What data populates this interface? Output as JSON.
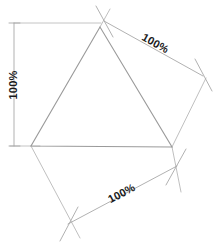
{
  "figure": {
    "background_color": "#ffffff",
    "shape_line_color": "#9a9a9a",
    "dimension_line_color": "#b4b4b4",
    "text_color": "#1a1a1a"
  },
  "shape": {
    "name": "triangle",
    "vertices": [
      {
        "label": "apex",
        "x": 100,
        "y": 27
      },
      {
        "label": "bottom-left",
        "x": 31,
        "y": 146
      },
      {
        "label": "bottom-right",
        "x": 172,
        "y": 147
      }
    ]
  },
  "dimensions": [
    {
      "id": "left",
      "label": "100%",
      "orientation": "vertical",
      "rotation_deg": -90,
      "line": {
        "x1": 14,
        "y1": 23,
        "x2": 14,
        "y2": 146
      },
      "text_position": {
        "x": 14,
        "y": 85
      },
      "extension_lines": [
        {
          "x1": 14,
          "y1": 23,
          "x2": 100,
          "y2": 23
        },
        {
          "x1": 10,
          "y1": 146,
          "x2": 40,
          "y2": 146
        }
      ],
      "ticks": [
        {
          "x1": 9,
          "y1": 23,
          "x2": 20,
          "y2": 23
        },
        {
          "x1": 9,
          "y1": 146,
          "x2": 20,
          "y2": 146
        }
      ]
    },
    {
      "id": "upper-right",
      "label": "100%",
      "orientation": "diagonal-down-right",
      "rotation_deg": 29,
      "line": {
        "x1": 104,
        "y1": 21,
        "x2": 203,
        "y2": 76
      },
      "text_position": {
        "x": 155,
        "y": 45
      },
      "extension_lines": [
        {
          "x1": 95,
          "y1": 5,
          "x2": 114,
          "y2": 38
        },
        {
          "x1": 194,
          "y1": 58,
          "x2": 212,
          "y2": 92
        }
      ],
      "ticks": [
        {
          "x1": 95,
          "y1": 5,
          "x2": 114,
          "y2": 38
        },
        {
          "x1": 194,
          "y1": 58,
          "x2": 212,
          "y2": 92
        }
      ]
    },
    {
      "id": "bottom",
      "label": "100%",
      "orientation": "diagonal-up-right",
      "rotation_deg": -28,
      "line": {
        "x1": 68,
        "y1": 224,
        "x2": 176,
        "y2": 167
      },
      "text_position": {
        "x": 122,
        "y": 195
      },
      "extension_lines": [
        {
          "x1": 60,
          "y1": 240,
          "x2": 79,
          "y2": 206
        },
        {
          "x1": 166,
          "y1": 184,
          "x2": 186,
          "y2": 150
        }
      ],
      "ticks": [
        {
          "x1": 60,
          "y1": 240,
          "x2": 79,
          "y2": 206
        },
        {
          "x1": 166,
          "y1": 184,
          "x2": 186,
          "y2": 150
        }
      ]
    }
  ],
  "construction_lines": [
    {
      "id": "apex-upper-extension",
      "x1": 100,
      "y1": 27,
      "x2": 110,
      "y2": 9
    },
    {
      "id": "right-vertex-to-upper-right",
      "x1": 172,
      "y1": 147,
      "x2": 205,
      "y2": 80
    },
    {
      "id": "left-vertex-to-bottom",
      "x1": 31,
      "y1": 146,
      "x2": 80,
      "y2": 237
    },
    {
      "id": "right-vertex-down",
      "x1": 172,
      "y1": 147,
      "x2": 180,
      "y2": 190
    }
  ]
}
